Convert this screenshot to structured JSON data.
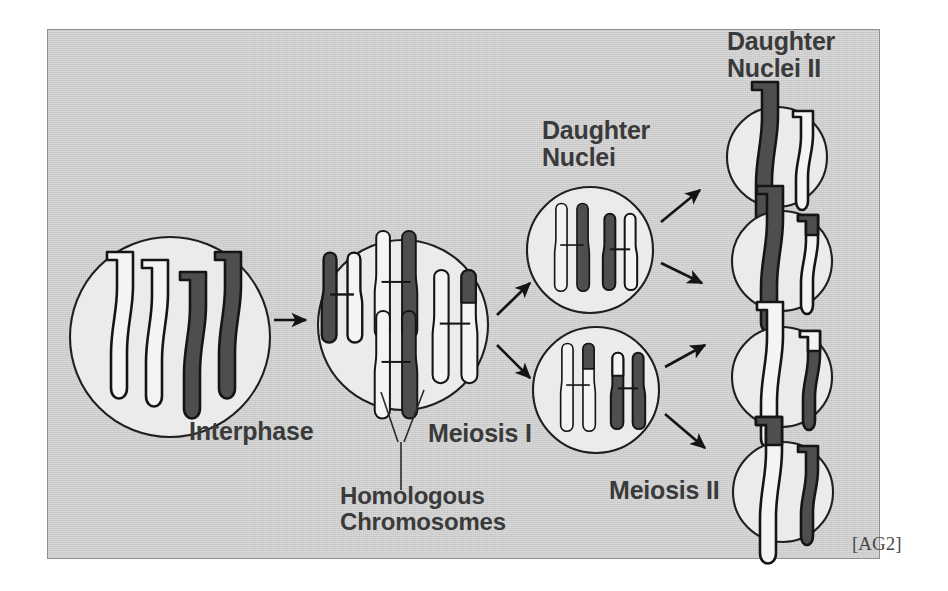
{
  "figure": {
    "title_credit": "[AG2]",
    "background_color": "#d2d2d2",
    "cell_fill": "#ebebeb",
    "dark_chromatid_color": "#4a4a4a",
    "light_chromatid_color": "#f2f2f2",
    "outline_color": "#1a1a1a",
    "text_color": "#3a3a3a"
  },
  "labels": {
    "interphase": "Interphase",
    "meiosis_one": "Meiosis I",
    "meiosis_two": "Meiosis II",
    "daughter_nuclei": "Daughter\nNuclei",
    "daughter_nuclei_two": "Daughter\nNuclei II",
    "homologous_chromosomes": "Homologous\nChromosomes"
  },
  "stages": [
    {
      "id": "interphase",
      "name": "Interphase",
      "cell_count": 1,
      "chromosomes": [
        {
          "size": "large",
          "form": "single-chromatid",
          "color": "light"
        },
        {
          "size": "large",
          "form": "single-chromatid",
          "color": "light"
        },
        {
          "size": "large",
          "form": "single-chromatid",
          "color": "dark"
        },
        {
          "size": "large",
          "form": "single-chromatid",
          "color": "dark"
        }
      ]
    },
    {
      "id": "meiosis-i",
      "name": "Meiosis I",
      "cell_count": 1,
      "chromosomes": [
        {
          "size": "small",
          "form": "duplicated-X",
          "color": "light",
          "crossover_arm": "upper-left-dark"
        },
        {
          "size": "large",
          "form": "duplicated-X",
          "color": "dark",
          "crossover_arm": "upper-left-light"
        },
        {
          "size": "large",
          "form": "duplicated-X",
          "color": "dark",
          "crossover_arm": "upper-left-light"
        },
        {
          "size": "large",
          "form": "duplicated-X",
          "color": "light",
          "crossover_arm": "upper-right-dark"
        }
      ]
    },
    {
      "id": "daughter-nuclei",
      "name": "Daughter Nuclei",
      "cell_count": 2,
      "cells": [
        {
          "chromosomes": [
            {
              "size": "large",
              "form": "duplicated-X",
              "color": "dark",
              "crossover_arm": "upper-left-light"
            },
            {
              "size": "small",
              "form": "duplicated-X",
              "color": "light",
              "crossover_arm": "upper-left-dark"
            }
          ]
        },
        {
          "chromosomes": [
            {
              "size": "large",
              "form": "duplicated-X",
              "color": "light",
              "crossover_arm": "upper-right-dark"
            },
            {
              "size": "small",
              "form": "duplicated-X",
              "color": "dark",
              "crossover_arm": "upper-left-light"
            }
          ]
        }
      ]
    },
    {
      "id": "daughter-nuclei-ii",
      "name": "Daughter Nuclei II",
      "cell_count": 4,
      "cells": [
        {
          "chromosomes": [
            {
              "size": "large",
              "form": "single-chromatid",
              "color": "dark"
            },
            {
              "size": "small",
              "form": "single-chromatid",
              "color": "light"
            }
          ]
        },
        {
          "chromosomes": [
            {
              "size": "large",
              "form": "single-chromatid",
              "color": "dark"
            },
            {
              "size": "small",
              "form": "single-chromatid",
              "color": "light",
              "tip": "dark"
            }
          ]
        },
        {
          "chromosomes": [
            {
              "size": "large",
              "form": "single-chromatid",
              "color": "light"
            },
            {
              "size": "small",
              "form": "single-chromatid",
              "color": "dark",
              "tip": "light"
            }
          ]
        },
        {
          "chromosomes": [
            {
              "size": "large",
              "form": "single-chromatid",
              "color": "light",
              "tip": "dark"
            },
            {
              "size": "small",
              "form": "single-chromatid",
              "color": "dark"
            }
          ]
        }
      ]
    }
  ],
  "arrows": [
    {
      "from": "interphase",
      "to": "meiosis-i",
      "direction": "right"
    },
    {
      "from": "meiosis-i",
      "to": "daughter-nuclei-upper",
      "direction": "up-right"
    },
    {
      "from": "meiosis-i",
      "to": "daughter-nuclei-lower",
      "direction": "down-right"
    },
    {
      "from": "daughter-nuclei-upper",
      "to": "daughter-nuclei-ii-1",
      "direction": "up-right"
    },
    {
      "from": "daughter-nuclei-upper",
      "to": "daughter-nuclei-ii-2",
      "direction": "down-right"
    },
    {
      "from": "daughter-nuclei-lower",
      "to": "daughter-nuclei-ii-3",
      "direction": "up-right"
    },
    {
      "from": "daughter-nuclei-lower",
      "to": "daughter-nuclei-ii-4",
      "direction": "down-right"
    }
  ]
}
